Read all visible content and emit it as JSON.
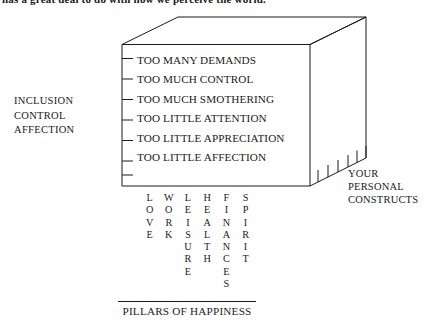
{
  "page": {
    "clipped_header_line": "has a great deal to do with how we perceive the world."
  },
  "diagram": {
    "title_caption": "PILLARS OF HAPPINESS",
    "left_axis": {
      "name": "interpersonal-needs-axis",
      "items": [
        "INCLUSION",
        "CONTROL",
        "AFFECTION"
      ]
    },
    "right_axis": {
      "name": "personal-constructs-axis",
      "lines": [
        "YOUR",
        "PERSONAL",
        "CONSTRUCTS"
      ]
    },
    "front_face_rows": [
      "TOO MANY DEMANDS",
      "TOO MUCH CONTROL",
      "TOO MUCH SMOTHERING",
      "TOO LITTLE ATTENTION",
      "TOO LITTLE APPRECIATION",
      "TOO LITTLE AFFECTION"
    ],
    "pillars": [
      "LOVE",
      "WORK",
      "LEISURE",
      "HEALTH",
      "FINANCES",
      "SPIRIT"
    ],
    "colors": {
      "stroke": "#1a1a1a",
      "text": "#1a1a1a",
      "background": "#ffffff"
    },
    "geometry": {
      "front_face": {
        "left": 122,
        "top": 44.5,
        "right": 310,
        "bottom": 186
      },
      "rear_top_right": {
        "x": 366,
        "y": 17
      },
      "rear_top_left": {
        "x": 178,
        "y": 17
      },
      "rear_bottom_right": {
        "x": 366,
        "y": 158
      },
      "left_edge_tick_count": 7,
      "depth_edge_tick_count": 6
    }
  }
}
